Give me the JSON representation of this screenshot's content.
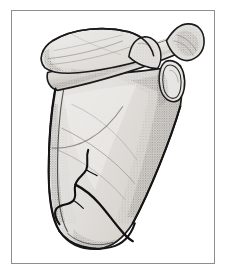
{
  "figure": {
    "title": "Scapula, posterior view, with fracture",
    "view": "posterior",
    "style": "pen-and-ink stipple medical illustration",
    "frame": {
      "border_color": "#8e8e8e",
      "border_width_px": 1,
      "background_color": "#ffffff",
      "left_px": 11,
      "top_px": 10,
      "width_px": 204,
      "height_px": 254
    },
    "palette": {
      "outline": "#1a1a1a",
      "bone_fill_light": "#ebeae8",
      "bone_fill_mid": "#dedcd8",
      "bone_fill_shadow": "#c8c5c0",
      "stipple": "#6f6c67",
      "fracture_line": "#111111",
      "page_background": "#ffffff"
    },
    "anatomy": [
      {
        "id": "supraspinous-fossa",
        "label": "Supraspinous fossa"
      },
      {
        "id": "spine-of-scapula",
        "label": "Spine of scapula"
      },
      {
        "id": "acromion-process",
        "label": "Acromion process"
      },
      {
        "id": "coracoid-process",
        "label": "Coracoid process"
      },
      {
        "id": "glenoid-cavity",
        "label": "Glenoid cavity"
      },
      {
        "id": "infraspinous-fossa",
        "label": "Infraspinous fossa"
      },
      {
        "id": "medial-border",
        "label": "Medial (vertebral) border"
      },
      {
        "id": "lateral-border",
        "label": "Lateral (axillary) border"
      },
      {
        "id": "superior-angle",
        "label": "Superior angle"
      },
      {
        "id": "inferior-angle",
        "label": "Inferior angle"
      },
      {
        "id": "fracture-line",
        "label": "Fracture line through scapular body"
      }
    ],
    "annotations": {
      "labels_visible": false,
      "caption_visible": false,
      "text_present": "none"
    }
  }
}
